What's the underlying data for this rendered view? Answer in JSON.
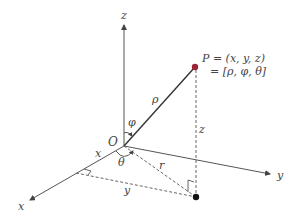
{
  "diagram": {
    "axes": {
      "x_label": "x",
      "y_label": "y",
      "z_label": "z"
    },
    "origin_label": "O",
    "point": {
      "label_line1": "P = (x, y, z)",
      "label_line2": "= [ρ, φ, θ]",
      "color": "#9b2335"
    },
    "segment_labels": {
      "rho": "ρ",
      "phi": "φ",
      "theta": "θ",
      "r": "r",
      "z_height": "z",
      "x_component": "x",
      "y_component": "y"
    },
    "colors": {
      "axis": "#555555",
      "rho_line": "#333333",
      "dashed": "#666666",
      "projection_point": "#111111"
    }
  }
}
